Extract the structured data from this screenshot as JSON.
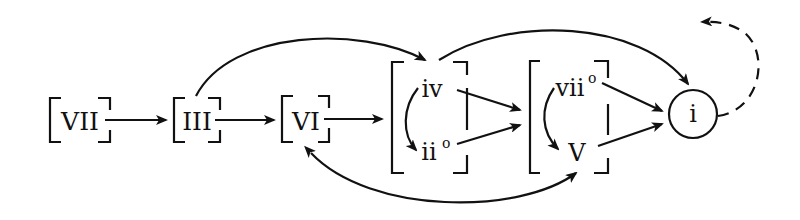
{
  "diagram": {
    "type": "harmonic-function-flowchart",
    "nodes": {
      "vii": {
        "label": "VII"
      },
      "iii": {
        "label": "III"
      },
      "vi": {
        "label": "VI"
      },
      "iv": {
        "label": "iv"
      },
      "ii": {
        "label": "ii",
        "sup": "o"
      },
      "viio": {
        "label": "vii",
        "sup": "o"
      },
      "v": {
        "label": "V"
      },
      "i": {
        "label": "i"
      }
    },
    "groups": [
      {
        "id": "predominant",
        "members": [
          "iv",
          "ii"
        ]
      },
      {
        "id": "dominant",
        "members": [
          "viio",
          "v"
        ]
      }
    ],
    "edges": [
      {
        "from": "VII",
        "to": "III",
        "style": "solid"
      },
      {
        "from": "III",
        "to": "VI",
        "style": "solid"
      },
      {
        "from": "VI",
        "to": "predominant-group",
        "style": "solid"
      },
      {
        "from": "III",
        "to": "iv",
        "style": "solid-arc"
      },
      {
        "from": "iv",
        "to": "i",
        "style": "solid-arc"
      },
      {
        "from": "iv",
        "to": "dominant-group",
        "style": "solid"
      },
      {
        "from": "ii°",
        "to": "dominant-group",
        "style": "solid"
      },
      {
        "from": "iv",
        "to": "ii°",
        "style": "solid-arc"
      },
      {
        "from": "vii°",
        "to": "V",
        "style": "solid-arc"
      },
      {
        "from": "vii°",
        "to": "i",
        "style": "solid"
      },
      {
        "from": "V",
        "to": "i",
        "style": "solid"
      },
      {
        "from": "V",
        "to": "VI",
        "style": "double-headed-arc"
      },
      {
        "from": "i",
        "to": "start",
        "style": "dashed-arc"
      }
    ]
  }
}
